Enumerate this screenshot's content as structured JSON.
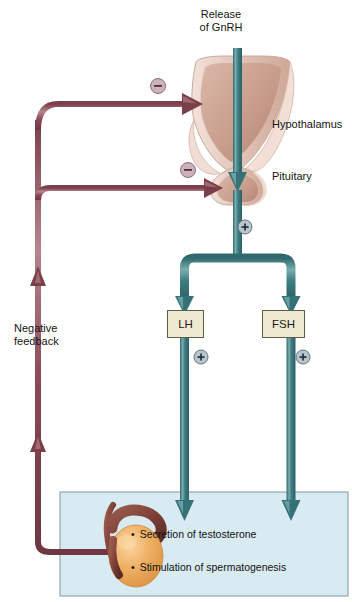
{
  "diagram": {
    "top_label": "Release\nof GnRH",
    "top_label_line1": "Release",
    "top_label_line2": "of GnRH",
    "organs": {
      "hypothalamus": "Hypothalamus",
      "pituitary": "Pituitary"
    },
    "hormones": {
      "lh": "LH",
      "fsh": "FSH"
    },
    "feedback_label_line1": "Negative",
    "feedback_label_line2": "feedback",
    "effects": [
      "Secretion of testosterone",
      "Stimulation of spermatogenesis"
    ],
    "signs": {
      "minus": "−",
      "plus": "+"
    },
    "colors": {
      "stimulatory_arrow": "#3c7b80",
      "stimulatory_arrow_light": "#7fb0b2",
      "feedback_arrow": "#8b4a55",
      "feedback_arrow_light": "#b08089",
      "hormone_box_fill": "#efe9d2",
      "hormone_box_border": "#5d5c4a",
      "target_box_fill": "#d8eaf2",
      "target_box_border": "#9aa6ab",
      "gland_fill": "#e8d2c8",
      "gland_shade": "#c09a8c",
      "testis_fill": "#eeab5e",
      "epididymis_fill": "#7e4038",
      "plus_circle": "#b9c4cc",
      "minus_circle": "#cdb3b9",
      "text": "#141414"
    }
  }
}
